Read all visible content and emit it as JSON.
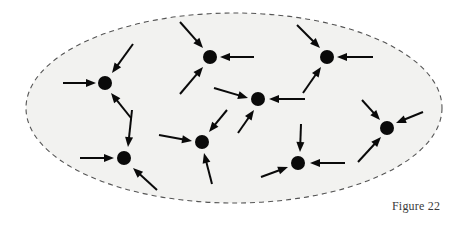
{
  "figure": {
    "caption": "Figure 22",
    "type": "directed-graph-sink-diagram",
    "background_color": "#ffffff"
  },
  "region": {
    "name": "dashed-ellipse-boundary",
    "shape": "ellipse",
    "cx": 234,
    "cy": 108,
    "rx": 208,
    "ry": 95,
    "fill_color": "#f2f2f0",
    "stroke_color": "#555555",
    "stroke_width": 1.1,
    "dash_pattern": "5,4"
  },
  "nodes": [
    {
      "id": "n1",
      "label": "node-left",
      "cx": 105,
      "cy": 83,
      "r": 7.0
    },
    {
      "id": "n2",
      "label": "node-top-center",
      "cx": 210,
      "cy": 57,
      "r": 7.0
    },
    {
      "id": "n3",
      "label": "node-top-right",
      "cx": 327,
      "cy": 57,
      "r": 7.0
    },
    {
      "id": "n4",
      "label": "node-center",
      "cx": 258,
      "cy": 99,
      "r": 7.0
    },
    {
      "id": "n5",
      "label": "node-right",
      "cx": 387,
      "cy": 128,
      "r": 7.0
    },
    {
      "id": "n6",
      "label": "node-bottom-left",
      "cx": 124,
      "cy": 158,
      "r": 7.0
    },
    {
      "id": "n7",
      "label": "node-bottom-center",
      "cx": 202,
      "cy": 142,
      "r": 7.0
    },
    {
      "id": "n8",
      "label": "node-bottom-right",
      "cx": 298,
      "cy": 163,
      "r": 7.0
    }
  ],
  "arrows": [
    {
      "id": "a1",
      "target": "n1",
      "x1": 63,
      "y1": 83,
      "x2": 96,
      "y2": 83,
      "direction": "right"
    },
    {
      "id": "a2",
      "target": "n1",
      "x1": 133,
      "y1": 44,
      "x2": 112,
      "y2": 73,
      "direction": "down-left"
    },
    {
      "id": "a3",
      "target": "n1",
      "x1": 131,
      "y1": 118,
      "x2": 111,
      "y2": 93,
      "direction": "up-left"
    },
    {
      "id": "a4",
      "target": "n2",
      "x1": 180,
      "y1": 22,
      "x2": 203,
      "y2": 48,
      "direction": "down-right"
    },
    {
      "id": "a5",
      "target": "n2",
      "x1": 254,
      "y1": 57,
      "x2": 220,
      "y2": 57,
      "direction": "left"
    },
    {
      "id": "a6",
      "target": "n2",
      "x1": 180,
      "y1": 94,
      "x2": 203,
      "y2": 67,
      "direction": "up-right"
    },
    {
      "id": "a7",
      "target": "n3",
      "x1": 297,
      "y1": 25,
      "x2": 320,
      "y2": 48,
      "direction": "down-right"
    },
    {
      "id": "a8",
      "target": "n3",
      "x1": 373,
      "y1": 57,
      "x2": 337,
      "y2": 57,
      "direction": "left"
    },
    {
      "id": "a9",
      "target": "n3",
      "x1": 303,
      "y1": 93,
      "x2": 321,
      "y2": 67,
      "direction": "up-right"
    },
    {
      "id": "a10",
      "target": "n4",
      "x1": 214,
      "y1": 88,
      "x2": 248,
      "y2": 98,
      "direction": "right"
    },
    {
      "id": "a11",
      "target": "n4",
      "x1": 305,
      "y1": 99,
      "x2": 269,
      "y2": 99,
      "direction": "left"
    },
    {
      "id": "a12",
      "target": "n4",
      "x1": 238,
      "y1": 133,
      "x2": 254,
      "y2": 110,
      "direction": "up-right"
    },
    {
      "id": "a13",
      "target": "n5",
      "x1": 362,
      "y1": 100,
      "x2": 380,
      "y2": 120,
      "direction": "down-right"
    },
    {
      "id": "a14",
      "target": "n5",
      "x1": 423,
      "y1": 112,
      "x2": 396,
      "y2": 123,
      "direction": "down-left"
    },
    {
      "id": "a15",
      "target": "n5",
      "x1": 358,
      "y1": 162,
      "x2": 381,
      "y2": 137,
      "direction": "up-right"
    },
    {
      "id": "a16",
      "target": "n6",
      "x1": 80,
      "y1": 158,
      "x2": 114,
      "y2": 158,
      "direction": "right"
    },
    {
      "id": "a17",
      "target": "n6",
      "x1": 132,
      "y1": 110,
      "x2": 128,
      "y2": 147,
      "direction": "down"
    },
    {
      "id": "a18",
      "target": "n6",
      "x1": 157,
      "y1": 190,
      "x2": 133,
      "y2": 168,
      "direction": "up-left"
    },
    {
      "id": "a19",
      "target": "n7",
      "x1": 159,
      "y1": 135,
      "x2": 192,
      "y2": 141,
      "direction": "right"
    },
    {
      "id": "a20",
      "target": "n7",
      "x1": 227,
      "y1": 110,
      "x2": 209,
      "y2": 132,
      "direction": "down-left"
    },
    {
      "id": "a21",
      "target": "n7",
      "x1": 212,
      "y1": 184,
      "x2": 204,
      "y2": 153,
      "direction": "up"
    },
    {
      "id": "a22",
      "target": "n8",
      "x1": 301,
      "y1": 124,
      "x2": 300,
      "y2": 152,
      "direction": "down"
    },
    {
      "id": "a23",
      "target": "n8",
      "x1": 345,
      "y1": 163,
      "x2": 310,
      "y2": 163,
      "direction": "left"
    },
    {
      "id": "a24",
      "target": "n8",
      "x1": 261,
      "y1": 177,
      "x2": 288,
      "y2": 167,
      "direction": "up-right"
    }
  ],
  "style": {
    "node_color": "#0a0a0a",
    "arrow_color": "#0a0a0a",
    "arrow_line_width": 2.0,
    "arrow_head_length": 10,
    "arrow_head_width": 8
  }
}
